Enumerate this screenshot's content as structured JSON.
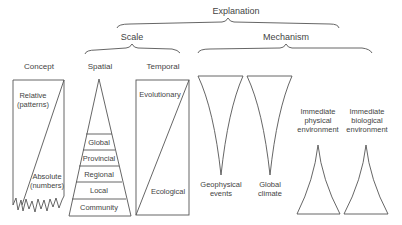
{
  "headers": {
    "explanation": "Explanation",
    "scale": "Scale",
    "mechanism": "Mechanism"
  },
  "columns": {
    "concept": {
      "title": "Concept",
      "top_label_1": "Relative",
      "top_label_2": "(patterns)",
      "bottom_label_1": "Absolute",
      "bottom_label_2": "(numbers)"
    },
    "spatial": {
      "title": "Spatial",
      "levels": [
        "Global",
        "Provincial",
        "Regional",
        "Local",
        "Community"
      ]
    },
    "temporal": {
      "title": "Temporal",
      "top_label": "Evolutionary",
      "bottom_label": "Ecological"
    },
    "geophysical": {
      "label_1": "Geophysical",
      "label_2": "events"
    },
    "global_climate": {
      "label_1": "Global",
      "label_2": "climate"
    },
    "immediate_physical": {
      "label_1": "Immediate",
      "label_2": "physical",
      "label_3": "environment"
    },
    "immediate_biological": {
      "label_1": "Immediate",
      "label_2": "biological",
      "label_3": "environment"
    }
  }
}
